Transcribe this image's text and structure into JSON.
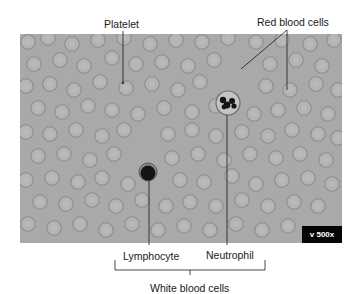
{
  "labels": {
    "platelet": "Platelet",
    "red_blood_cells": "Red blood cells",
    "lymphocyte": "Lymphocyte",
    "neutrophil": "Neutrophil",
    "white_blood_cells": "White blood cells"
  },
  "magnification": "v 500x",
  "colors": {
    "background": "#a9a9a9",
    "rbc_fill": "#b4b4b4",
    "rbc_rim": "#8e8e8e",
    "nucleus": "#141414",
    "leader_line": "#1a1a1a",
    "badge": "#050505"
  },
  "red_cells": [
    [
      8,
      8
    ],
    [
      28,
      4
    ],
    [
      52,
      10
    ],
    [
      78,
      6
    ],
    [
      104,
      4
    ],
    [
      130,
      10
    ],
    [
      156,
      6
    ],
    [
      182,
      8
    ],
    [
      208,
      4
    ],
    [
      236,
      8
    ],
    [
      262,
      6
    ],
    [
      290,
      10
    ],
    [
      314,
      6
    ],
    [
      14,
      30
    ],
    [
      40,
      26
    ],
    [
      64,
      32
    ],
    [
      92,
      24
    ],
    [
      116,
      30
    ],
    [
      142,
      28
    ],
    [
      168,
      32
    ],
    [
      194,
      26
    ],
    [
      250,
      30
    ],
    [
      276,
      26
    ],
    [
      302,
      32
    ],
    [
      6,
      52
    ],
    [
      30,
      50
    ],
    [
      54,
      56
    ],
    [
      80,
      48
    ],
    [
      106,
      54
    ],
    [
      132,
      50
    ],
    [
      158,
      56
    ],
    [
      180,
      48
    ],
    [
      246,
      52
    ],
    [
      270,
      56
    ],
    [
      296,
      50
    ],
    [
      318,
      56
    ],
    [
      18,
      74
    ],
    [
      42,
      78
    ],
    [
      68,
      72
    ],
    [
      92,
      76
    ],
    [
      118,
      80
    ],
    [
      144,
      74
    ],
    [
      172,
      78
    ],
    [
      196,
      72
    ],
    [
      234,
      80
    ],
    [
      258,
      76
    ],
    [
      284,
      74
    ],
    [
      308,
      80
    ],
    [
      6,
      98
    ],
    [
      30,
      100
    ],
    [
      56,
      96
    ],
    [
      82,
      102
    ],
    [
      104,
      96
    ],
    [
      148,
      100
    ],
    [
      172,
      96
    ],
    [
      196,
      102
    ],
    [
      222,
      98
    ],
    [
      248,
      102
    ],
    [
      272,
      96
    ],
    [
      298,
      100
    ],
    [
      318,
      104
    ],
    [
      18,
      122
    ],
    [
      44,
      120
    ],
    [
      70,
      126
    ],
    [
      94,
      120
    ],
    [
      152,
      124
    ],
    [
      178,
      120
    ],
    [
      204,
      126
    ],
    [
      230,
      120
    ],
    [
      256,
      124
    ],
    [
      280,
      120
    ],
    [
      306,
      126
    ],
    [
      6,
      146
    ],
    [
      32,
      144
    ],
    [
      58,
      148
    ],
    [
      82,
      144
    ],
    [
      108,
      150
    ],
    [
      160,
      146
    ],
    [
      184,
      148
    ],
    [
      212,
      142
    ],
    [
      236,
      150
    ],
    [
      262,
      146
    ],
    [
      288,
      144
    ],
    [
      312,
      150
    ],
    [
      20,
      168
    ],
    [
      46,
      170
    ],
    [
      72,
      166
    ],
    [
      96,
      172
    ],
    [
      122,
      166
    ],
    [
      146,
      172
    ],
    [
      170,
      168
    ],
    [
      196,
      172
    ],
    [
      222,
      166
    ],
    [
      248,
      172
    ],
    [
      274,
      168
    ],
    [
      298,
      172
    ],
    [
      8,
      190
    ],
    [
      34,
      194
    ],
    [
      60,
      190
    ],
    [
      86,
      196
    ],
    [
      112,
      190
    ],
    [
      138,
      196
    ],
    [
      164,
      192
    ],
    [
      190,
      196
    ],
    [
      216,
      190
    ],
    [
      242,
      196
    ],
    [
      268,
      192
    ]
  ],
  "neutrophil_cell": {
    "cx": 208,
    "cy": 69,
    "r": 12
  },
  "lymphocyte_cell": {
    "cx": 128,
    "cy": 138,
    "r": 9
  },
  "platelet_dot": {
    "cx": 103,
    "cy": 49
  }
}
